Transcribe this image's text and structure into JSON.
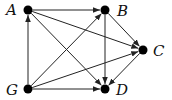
{
  "graph": {
    "type": "directed",
    "nodes": [
      {
        "id": "A",
        "label": "A",
        "x": 28,
        "y": 10,
        "label_x": 6,
        "label_y": 15
      },
      {
        "id": "B",
        "label": "B",
        "x": 105,
        "y": 10,
        "label_x": 117,
        "label_y": 16
      },
      {
        "id": "C",
        "label": "C",
        "x": 143,
        "y": 50,
        "label_x": 153,
        "label_y": 56
      },
      {
        "id": "D",
        "label": "D",
        "x": 105,
        "y": 89,
        "label_x": 116,
        "label_y": 95
      },
      {
        "id": "G",
        "label": "G",
        "x": 28,
        "y": 89,
        "label_x": 6,
        "label_y": 95
      }
    ],
    "edges": [
      {
        "from": "A",
        "to": "B"
      },
      {
        "from": "A",
        "to": "C"
      },
      {
        "from": "A",
        "to": "D"
      },
      {
        "from": "G",
        "to": "A"
      },
      {
        "from": "G",
        "to": "B"
      },
      {
        "from": "G",
        "to": "C"
      },
      {
        "from": "G",
        "to": "D"
      },
      {
        "from": "B",
        "to": "C"
      },
      {
        "from": "B",
        "to": "D"
      },
      {
        "from": "C",
        "to": "D"
      }
    ],
    "colors": {
      "node": "#000000",
      "edge": "#222222",
      "label": "#111111"
    }
  }
}
